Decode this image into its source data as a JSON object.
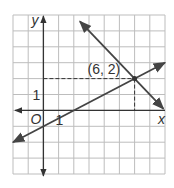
{
  "chart_data": {
    "type": "line",
    "title": "",
    "xlabel": "x",
    "ylabel": "y",
    "origin_label": "O",
    "xlim": [
      -2,
      8
    ],
    "ylim": [
      -4,
      6
    ],
    "grid": true,
    "tick_labels": {
      "x": "1",
      "y": "1"
    },
    "series": [
      {
        "name": "rising line",
        "equation": "y = 0.5x - 1",
        "slope": 0.5,
        "intercept": -1,
        "x_range": [
          -2.0,
          8.0
        ],
        "arrows": "both"
      },
      {
        "name": "falling line",
        "equation": "y = -x + 8",
        "slope": -1,
        "intercept": 8,
        "x_range": [
          2.4,
          7.9
        ],
        "arrows": "both"
      }
    ],
    "annotations": [
      {
        "type": "point",
        "x": 6,
        "y": 2,
        "label": "(6, 2)",
        "dashed_guides": true
      }
    ]
  },
  "colors": {
    "grid": "#bdbdbd",
    "axis": "#333333",
    "line": "#444444",
    "background": "#ffffff"
  }
}
